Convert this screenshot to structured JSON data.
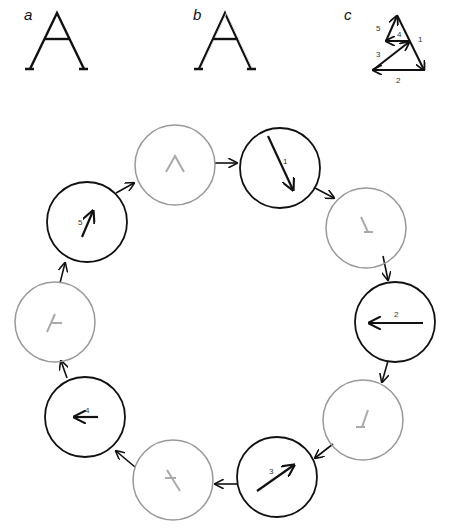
{
  "panels": {
    "a": {
      "label": "a"
    },
    "b": {
      "label": "b"
    },
    "c": {
      "label": "c",
      "stroke_numbers": [
        "1",
        "2",
        "3",
        "4",
        "5"
      ]
    }
  },
  "cycle": {
    "stroke_labels": [
      "1",
      "2",
      "3",
      "4",
      "5"
    ]
  },
  "colors": {
    "active": "#111111",
    "inactive": "#999999",
    "faded": "#bbbbbb"
  }
}
